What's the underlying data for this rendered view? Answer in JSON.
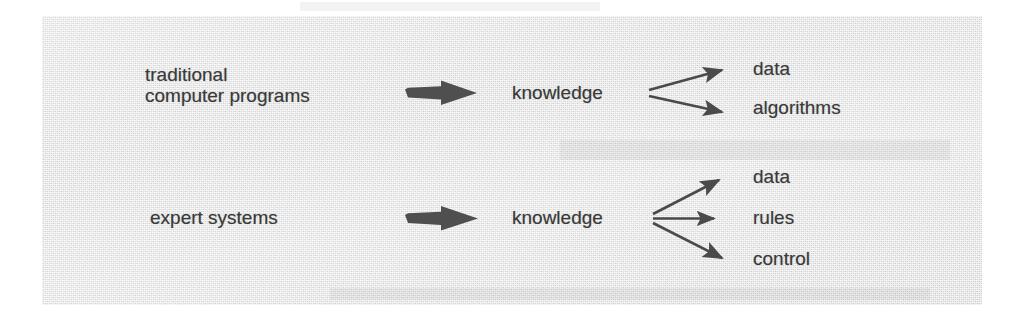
{
  "figure": {
    "kind": "comparison-diagram",
    "panel_background_color": "#e2e2e2",
    "ink_color": "#3a3a3a",
    "page_background_color": "#ffffff"
  },
  "rows": [
    {
      "id": "traditional",
      "source_label": "traditional\ncomputer programs",
      "source_line_1": "traditional",
      "source_line_2": "computer programs",
      "thick_arrow": "thick-right-arrow",
      "middle_label": "knowledge",
      "branch_count": 2,
      "branches": [
        {
          "label": "data"
        },
        {
          "label": "algorithms"
        }
      ]
    },
    {
      "id": "expert-systems",
      "source_label": "expert systems",
      "source_line_1": "expert systems",
      "source_line_2": "",
      "thick_arrow": "thick-right-arrow",
      "middle_label": "knowledge",
      "branch_count": 3,
      "branches": [
        {
          "label": "data"
        },
        {
          "label": "rules"
        },
        {
          "label": "control"
        }
      ]
    }
  ]
}
